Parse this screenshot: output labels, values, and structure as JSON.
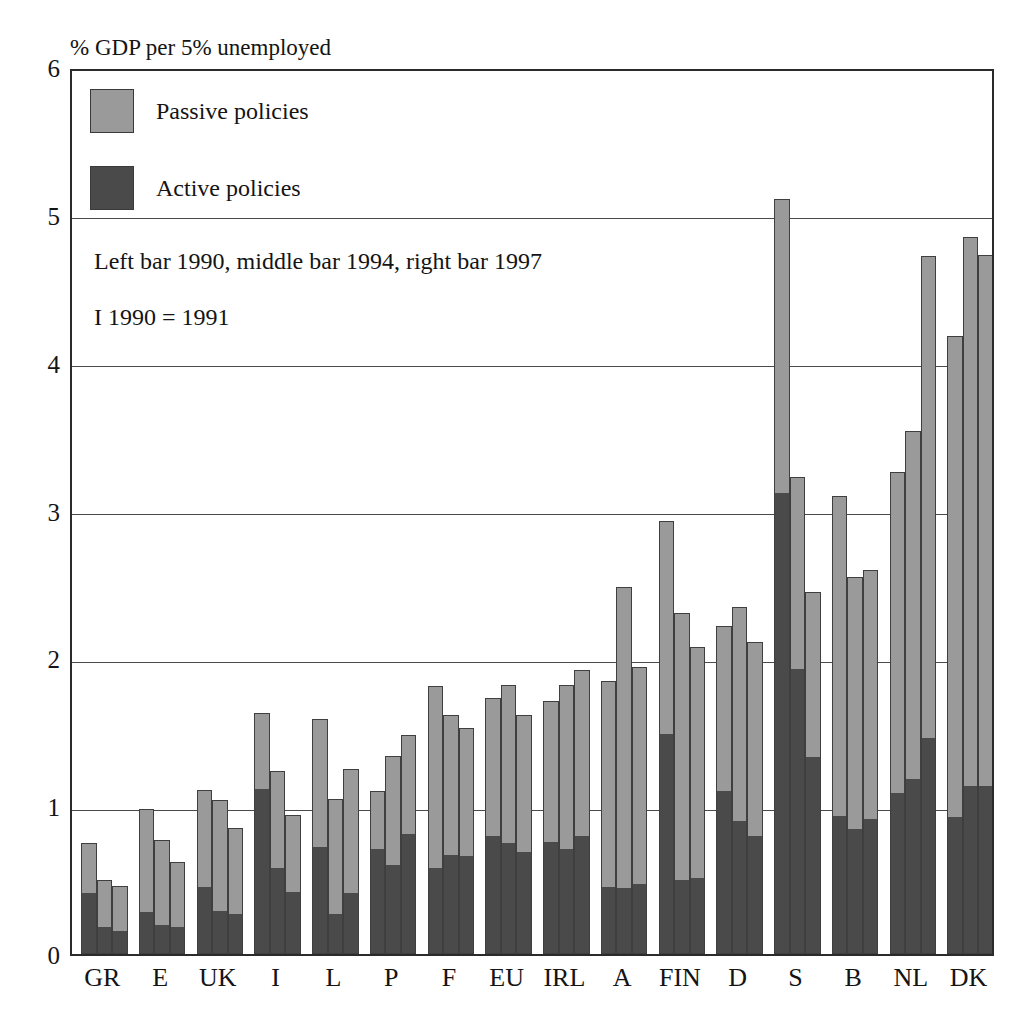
{
  "chart_data": {
    "type": "bar",
    "subtype": "grouped-stacked",
    "title": "% GDP per 5% unemployed",
    "xlabel": "",
    "ylabel": "% GDP per 5% unemployed",
    "ylim": [
      0,
      6
    ],
    "yticks": [
      "0",
      "1",
      "2",
      "3",
      "4",
      "5",
      "6"
    ],
    "grid": true,
    "legend_position": "top-left-inside",
    "annotations": [
      "Left bar 1990, middle bar 1994, right bar 1997",
      "I  1990 = 1991"
    ],
    "group_labels": [
      "1990",
      "1994",
      "1997"
    ],
    "categories": [
      "GR",
      "E",
      "UK",
      "I",
      "L",
      "P",
      "F",
      "EU",
      "IRL",
      "A",
      "FIN",
      "D",
      "S",
      "B",
      "NL",
      "DK"
    ],
    "series": [
      {
        "name": "Active policies",
        "color": "#4a4a4a",
        "values_by_year": {
          "1990": [
            0.41,
            0.28,
            0.45,
            1.12,
            0.72,
            0.71,
            0.58,
            0.8,
            0.76,
            0.45,
            1.49,
            1.1,
            3.12,
            0.93,
            1.09,
            0.92
          ],
          "1994": [
            0.18,
            0.19,
            0.29,
            0.58,
            0.27,
            0.6,
            0.67,
            0.75,
            0.71,
            0.44,
            0.5,
            0.9,
            1.93,
            0.84,
            1.18,
            1.13
          ],
          "1997": [
            0.15,
            0.18,
            0.27,
            0.42,
            0.41,
            0.81,
            0.66,
            0.69,
            0.8,
            0.47,
            0.51,
            0.8,
            1.33,
            0.91,
            1.46,
            1.13
          ]
        }
      },
      {
        "name": "Passive policies",
        "color": "#9a9a9a",
        "values_by_year": {
          "1990": [
            0.34,
            0.7,
            0.66,
            0.51,
            0.87,
            0.39,
            1.23,
            0.93,
            0.95,
            1.4,
            1.44,
            1.12,
            1.99,
            2.17,
            2.17,
            3.26
          ],
          "1994": [
            0.32,
            0.58,
            0.75,
            0.66,
            0.78,
            0.74,
            0.95,
            1.07,
            1.11,
            2.04,
            1.81,
            1.45,
            1.3,
            1.71,
            2.36,
            3.72
          ],
          "1997": [
            0.31,
            0.44,
            0.58,
            0.52,
            0.84,
            0.67,
            0.87,
            0.93,
            1.12,
            1.47,
            1.57,
            1.31,
            1.12,
            1.69,
            3.26,
            3.6
          ]
        }
      }
    ],
    "totals": {
      "1990": [
        0.75,
        0.98,
        1.11,
        1.63,
        1.59,
        1.1,
        1.81,
        1.73,
        1.71,
        1.85,
        2.93,
        2.22,
        5.11,
        3.1,
        3.26,
        4.18
      ],
      "1994": [
        0.5,
        0.77,
        1.04,
        1.24,
        1.05,
        1.34,
        1.62,
        1.82,
        1.82,
        2.48,
        2.31,
        2.35,
        3.23,
        2.55,
        3.54,
        4.85
      ],
      "1997": [
        0.46,
        0.62,
        0.85,
        0.94,
        1.25,
        1.48,
        1.53,
        1.62,
        1.92,
        1.94,
        2.08,
        2.11,
        2.45,
        2.6,
        4.72,
        4.73
      ]
    }
  },
  "legend": {
    "items": [
      {
        "label": "Passive policies",
        "color": "#9a9a9a"
      },
      {
        "label": "Active policies",
        "color": "#4a4a4a"
      }
    ]
  },
  "colors": {
    "passive": "#9a9a9a",
    "active": "#4a4a4a",
    "frame": "#2b2b2b",
    "grid": "#4a4a4a",
    "text": "#141414",
    "background": "#ffffff"
  }
}
